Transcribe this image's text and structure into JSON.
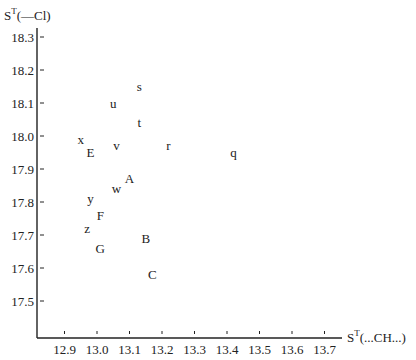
{
  "chart_data": {
    "type": "scatter",
    "title": "",
    "xlabel": "S^T(...CH...)",
    "ylabel": "S^T(—Cl)",
    "xlim": [
      12.82,
      13.8
    ],
    "ylim": [
      17.39,
      18.37
    ],
    "grid": false,
    "legend": null,
    "x_ticks": [
      "12.9",
      "13.0",
      "13.1",
      "13.2",
      "13.3",
      "13.4",
      "13.5",
      "13.6",
      "13.7"
    ],
    "y_ticks": [
      "18.3",
      "18.2",
      "18.1",
      "18.0",
      "17.9",
      "17.8",
      "17.7",
      "17.6",
      "17.5"
    ],
    "points": [
      {
        "label": "s",
        "x": 13.13,
        "y": 18.15
      },
      {
        "label": "u",
        "x": 13.05,
        "y": 18.1
      },
      {
        "label": "t",
        "x": 13.13,
        "y": 18.04
      },
      {
        "label": "x",
        "x": 12.95,
        "y": 17.99
      },
      {
        "label": "E",
        "x": 12.98,
        "y": 17.95
      },
      {
        "label": "v",
        "x": 13.06,
        "y": 17.97
      },
      {
        "label": "r",
        "x": 13.22,
        "y": 17.97
      },
      {
        "label": "q",
        "x": 13.42,
        "y": 17.95
      },
      {
        "label": "A",
        "x": 13.1,
        "y": 17.87
      },
      {
        "label": "w",
        "x": 13.06,
        "y": 17.84
      },
      {
        "label": "y",
        "x": 12.98,
        "y": 17.81
      },
      {
        "label": "F",
        "x": 13.01,
        "y": 17.76
      },
      {
        "label": "z",
        "x": 12.97,
        "y": 17.72
      },
      {
        "label": "G",
        "x": 13.01,
        "y": 17.66
      },
      {
        "label": "B",
        "x": 13.15,
        "y": 17.69
      },
      {
        "label": "C",
        "x": 13.17,
        "y": 17.58
      }
    ]
  },
  "axes": {
    "y_title_main": "S",
    "y_title_sup": "T",
    "y_title_rest": "(—Cl)",
    "x_title_main": "S",
    "x_title_sup": "T",
    "x_title_rest": "(...CH...)"
  }
}
